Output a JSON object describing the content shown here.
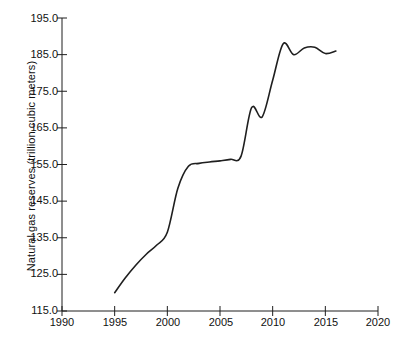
{
  "chart_data": {
    "type": "line",
    "title": "",
    "xlabel": "",
    "ylabel": "Natural gas reserves (trillion cubic meters)",
    "xlim": [
      1990,
      2020
    ],
    "ylim": [
      115.0,
      195.0
    ],
    "grid": false,
    "legend": "none",
    "line_color": "#1f1f1f",
    "xticks": [
      1990,
      1995,
      2000,
      2005,
      2010,
      2015,
      2020
    ],
    "xtick_labels": [
      "1990",
      "1995",
      "2000",
      "2005",
      "2010",
      "2015",
      "2020"
    ],
    "yticks": [
      115.0,
      125.0,
      135.0,
      145.0,
      155.0,
      165.0,
      175.0,
      185.0,
      195.0
    ],
    "ytick_labels": [
      "115.0",
      "125.0",
      "135.0",
      "145.0",
      "155.0",
      "165.0",
      "175.0",
      "185.0",
      "195.0"
    ],
    "series": [
      {
        "name": "Natural gas reserves",
        "x": [
          1995,
          1996,
          1997,
          1998,
          1999,
          2000,
          2001,
          2002,
          2003,
          2004,
          2005,
          2006,
          2007,
          2008,
          2009,
          2010,
          2011,
          2012,
          2013,
          2014,
          2015,
          2016
        ],
        "values": [
          120.0,
          124.0,
          127.5,
          130.5,
          133.0,
          136.5,
          148.5,
          154.5,
          155.3,
          155.7,
          156.0,
          156.4,
          157.3,
          170.5,
          168.0,
          178.0,
          188.0,
          185.0,
          186.8,
          187.0,
          185.3,
          186.0
        ]
      }
    ],
    "annotations": []
  },
  "caption": {
    "fragment": ""
  }
}
